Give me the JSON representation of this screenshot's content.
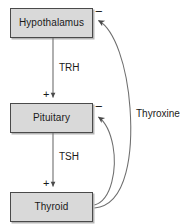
{
  "diagram": {
    "type": "feedback-loop",
    "colors": {
      "box_fill": "#d9d9d9",
      "box_border": "#4a4a4a",
      "line": "#6e6e6e",
      "text": "#1a1a1a",
      "background": "#ffffff"
    },
    "nodes": [
      {
        "id": "hypothalamus",
        "label": "Hypothalamus",
        "x": 10,
        "y": 8,
        "width": 83,
        "height": 30
      },
      {
        "id": "pituitary",
        "label": "Pituitary",
        "x": 10,
        "y": 103,
        "width": 83,
        "height": 30
      },
      {
        "id": "thyroid",
        "label": "Thyroid",
        "x": 10,
        "y": 192,
        "width": 83,
        "height": 30
      }
    ],
    "edges": [
      {
        "id": "trh",
        "label": "TRH",
        "from": "hypothalamus",
        "to": "pituitary",
        "sign": "+",
        "kind": "stimulatory",
        "label_x": 59,
        "label_y": 63,
        "sign_x": 43,
        "sign_y": 89
      },
      {
        "id": "tsh",
        "label": "TSH",
        "from": "pituitary",
        "to": "thyroid",
        "sign": "+",
        "kind": "stimulatory",
        "label_x": 59,
        "label_y": 152,
        "sign_x": 43,
        "sign_y": 178
      },
      {
        "id": "thyroxine-to-hypothalamus",
        "label": "",
        "from": "thyroid",
        "to": "hypothalamus",
        "sign": "−",
        "kind": "inhibitory",
        "sign_x": 95,
        "sign_y": 5
      },
      {
        "id": "thyroxine-to-pituitary",
        "label": "",
        "from": "thyroid",
        "to": "pituitary",
        "sign": "−",
        "kind": "inhibitory",
        "sign_x": 95,
        "sign_y": 100
      }
    ],
    "feedback_label": {
      "text": "Thyroxine",
      "x": 136,
      "y": 109
    }
  }
}
